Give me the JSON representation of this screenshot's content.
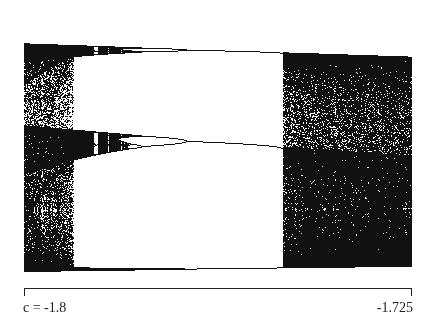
{
  "chart_data": {
    "type": "scatter",
    "title": "",
    "subtitle": "Bifurcation diagram of x -> x^2 + c, period-3 window",
    "xlabel": "c",
    "ylabel": "",
    "xlim": [
      -1.8,
      -1.725
    ],
    "x_axis_direction": "left-to-right from -1.8 to -1.725",
    "tick_labels": {
      "left": "c = -1.8",
      "right": "-1.725"
    },
    "grid": false,
    "legend": null,
    "regions": [
      {
        "name": "chaotic-left",
        "c_range": [
          -1.8,
          -1.7895
        ],
        "description": "dense chaotic band"
      },
      {
        "name": "period-3-window",
        "c_range": [
          -1.7895,
          -1.768
        ],
        "description": "three stable branches with period-doubling cascade at left"
      },
      {
        "name": "chaotic-right",
        "c_range": [
          -1.768,
          -1.725
        ],
        "description": "dense chaotic band after intermittency onset"
      }
    ],
    "branches": [
      {
        "name": "upper-branch",
        "y_px_left": 22,
        "y_px_right": 27
      },
      {
        "name": "middle-branch",
        "y_px_left": 124,
        "y_px_right": 133
      },
      {
        "name": "lower-branch",
        "y_px_left": 269,
        "y_px_right": 268
      }
    ]
  },
  "axis": {
    "left_label": "c = -1.8",
    "right_label": "-1.725"
  },
  "colors": {
    "ink": "#111111",
    "paper": "#ffffff"
  }
}
